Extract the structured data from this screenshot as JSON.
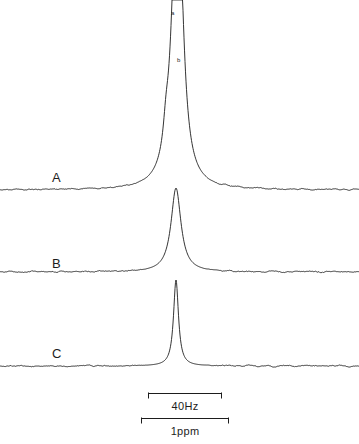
{
  "figure": {
    "kind": "nmr-spectra-stack",
    "background_color": "#ffffff",
    "trace_color": "#1d1d1d",
    "trace_labels": [
      {
        "id": "A",
        "label": "A",
        "x": 52,
        "y": 170
      },
      {
        "id": "B",
        "label": "B",
        "x": 52,
        "y": 256
      },
      {
        "id": "C",
        "label": "C",
        "x": 52,
        "y": 346
      }
    ],
    "peak_labels": [
      {
        "id": "a",
        "label": "a",
        "x": 171,
        "y": 10
      },
      {
        "id": "b",
        "label": "b",
        "x": 177,
        "y": 57
      }
    ],
    "scalebars": [
      {
        "id": "hz",
        "label": "40Hz",
        "x": 148,
        "y": 392,
        "width": 74
      },
      {
        "id": "ppm",
        "label": "1ppm",
        "x": 141,
        "y": 417,
        "width": 88
      }
    ]
  },
  "chart_data": {
    "type": "line",
    "title": "",
    "subtitle": "",
    "xlabel": "",
    "ylabel": "",
    "grid": false,
    "legend": "none",
    "axis_visible": false,
    "xlim": [
      0,
      359
    ],
    "x_axis_units": "Hz",
    "scale_reference": {
      "40Hz_px": 74,
      "1ppm_px": 88
    },
    "annotations": [
      {
        "text": "a",
        "target": "trace A main peak apex",
        "x": 171,
        "y": 10
      },
      {
        "text": "b",
        "target": "trace A right shoulder",
        "x": 177,
        "y": 57
      },
      {
        "text": "40Hz",
        "target": "horizontal scale bar",
        "x": 185,
        "y": 400
      },
      {
        "text": "1ppm",
        "target": "horizontal scale bar",
        "x": 185,
        "y": 425
      }
    ],
    "series": [
      {
        "name": "A",
        "label": "A",
        "baseline_y": 190,
        "peak_center_x": 176,
        "peak_apex_y": 22,
        "peak_height_px": 168,
        "features": [
          {
            "type": "main-peak",
            "center_x": 176,
            "apex_y": 22,
            "half_width_px": 7
          },
          {
            "type": "shoulder",
            "center_x": 180,
            "apex_y": 66,
            "note": "labelled b, right side of main peak"
          },
          {
            "type": "small-peak",
            "center_x": 166,
            "apex_y": 168,
            "note": "left of base doublet"
          },
          {
            "type": "small-peak",
            "center_x": 174,
            "apex_y": 157,
            "note": "right of base doublet"
          }
        ],
        "noise": true
      },
      {
        "name": "B",
        "label": "B",
        "baseline_y": 272,
        "peak_center_x": 176,
        "peak_apex_y": 188,
        "peak_height_px": 84,
        "features": [
          {
            "type": "main-peak",
            "center_x": 176,
            "apex_y": 188,
            "half_width_px": 6,
            "note": "symmetric singlet, clipped at top of band"
          }
        ],
        "noise": true
      },
      {
        "name": "C",
        "label": "C",
        "baseline_y": 366,
        "peak_center_x": 176,
        "peak_apex_y": 280,
        "peak_height_px": 86,
        "features": [
          {
            "type": "main-peak",
            "center_x": 176,
            "apex_y": 280,
            "half_width_px": 3,
            "note": "narrow sharp singlet"
          }
        ],
        "noise": true
      }
    ]
  }
}
